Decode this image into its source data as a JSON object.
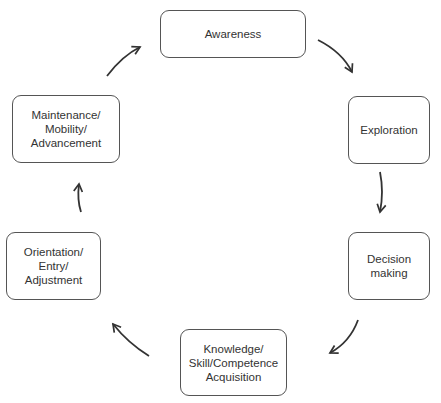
{
  "diagram": {
    "type": "cycle",
    "stages": [
      {
        "id": "awareness",
        "label": "Awareness"
      },
      {
        "id": "exploration",
        "label": "Exploration"
      },
      {
        "id": "decision-making",
        "label": "Decision\nmaking"
      },
      {
        "id": "knowledge",
        "label": "Knowledge/\nSkill/Competence\nAcquisition"
      },
      {
        "id": "orientation",
        "label": "Orientation/\nEntry/\nAdjustment"
      },
      {
        "id": "maintenance",
        "label": "Maintenance/\nMobility/\nAdvancement"
      }
    ],
    "edges": [
      {
        "from": "awareness",
        "to": "exploration"
      },
      {
        "from": "exploration",
        "to": "decision-making"
      },
      {
        "from": "decision-making",
        "to": "knowledge"
      },
      {
        "from": "knowledge",
        "to": "orientation"
      },
      {
        "from": "orientation",
        "to": "maintenance"
      },
      {
        "from": "maintenance",
        "to": "awareness"
      }
    ],
    "colors": {
      "stroke": "#555555",
      "arrow": "#333333",
      "text": "#333333"
    }
  }
}
